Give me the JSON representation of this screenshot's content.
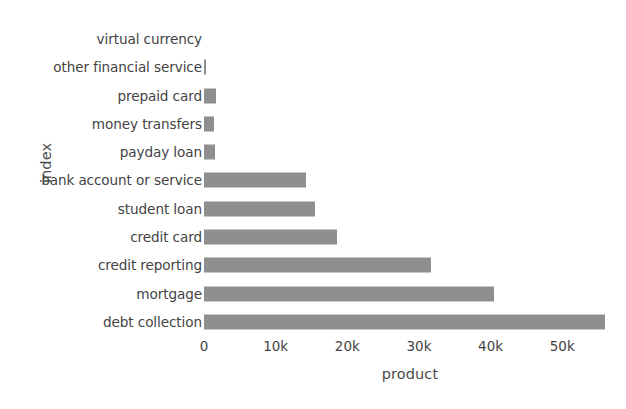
{
  "chart_data": {
    "type": "bar",
    "orientation": "horizontal",
    "title": "",
    "xlabel": "product",
    "ylabel": "index",
    "categories": [
      "virtual currency",
      "other financial service",
      "prepaid card",
      "money transfers",
      "payday loan",
      "bank account or service",
      "student loan",
      "credit card",
      "credit reporting",
      "mortgage",
      "debt collection"
    ],
    "values": [
      0,
      300,
      1700,
      1400,
      1500,
      14200,
      15500,
      18600,
      31700,
      40500,
      56000
    ],
    "xlim": [
      0,
      57500
    ],
    "xticks": [
      0,
      10000,
      20000,
      30000,
      40000,
      50000
    ],
    "xtick_labels": [
      "0",
      "10k",
      "20k",
      "30k",
      "40k",
      "50k"
    ],
    "grid": false,
    "legend": null,
    "bar_color": "#8f8f8f",
    "background_color": "#ffffff"
  }
}
